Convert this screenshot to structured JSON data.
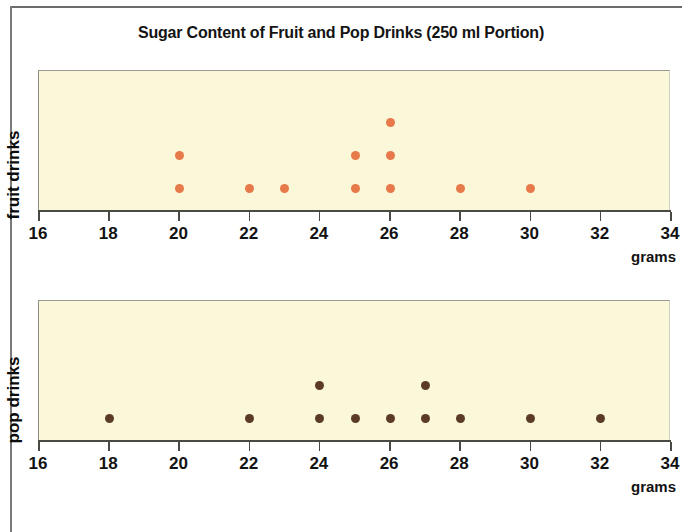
{
  "title": "Sugar Content of Fruit and Pop Drinks (250 ml Portion)",
  "units_label": "grams",
  "panels": [
    {
      "id": "fruit",
      "y_label": "fruit drinks",
      "color": "#e8794a"
    },
    {
      "id": "pop",
      "y_label": "pop drinks",
      "color": "#5c3a28"
    }
  ],
  "chart_data": {
    "type": "scatter",
    "title": "Sugar Content of Fruit and Pop Drinks (250 ml Portion)",
    "subtitle": "",
    "xlabel": "grams",
    "ylabel": "",
    "xlim": [
      16,
      34
    ],
    "xticks": [
      16,
      18,
      20,
      22,
      24,
      26,
      28,
      30,
      32,
      34
    ],
    "xtick_labels": [
      "16",
      "18",
      "20",
      "22",
      "24",
      "26",
      "28",
      "30",
      "32",
      "34"
    ],
    "grid": false,
    "legend": "none",
    "plot_background": "#faf8d8",
    "series": [
      {
        "name": "fruit drinks",
        "color": "#e8794a",
        "panel": "fruit",
        "count": 11,
        "values": [
          20,
          20,
          22,
          23,
          25,
          25,
          26,
          26,
          26,
          28,
          30
        ],
        "stacks": [
          {
            "x": 20,
            "count": 2
          },
          {
            "x": 22,
            "count": 1
          },
          {
            "x": 23,
            "count": 1
          },
          {
            "x": 25,
            "count": 2
          },
          {
            "x": 26,
            "count": 3
          },
          {
            "x": 28,
            "count": 1
          },
          {
            "x": 30,
            "count": 1
          }
        ]
      },
      {
        "name": "pop drinks",
        "color": "#5c3a28",
        "panel": "pop",
        "count": 11,
        "values": [
          18,
          22,
          24,
          24,
          25,
          26,
          27,
          27,
          28,
          30,
          32
        ],
        "stacks": [
          {
            "x": 18,
            "count": 1
          },
          {
            "x": 22,
            "count": 1
          },
          {
            "x": 24,
            "count": 2
          },
          {
            "x": 25,
            "count": 1
          },
          {
            "x": 26,
            "count": 1
          },
          {
            "x": 27,
            "count": 2
          },
          {
            "x": 28,
            "count": 1
          },
          {
            "x": 30,
            "count": 1
          },
          {
            "x": 32,
            "count": 1
          }
        ]
      }
    ]
  }
}
